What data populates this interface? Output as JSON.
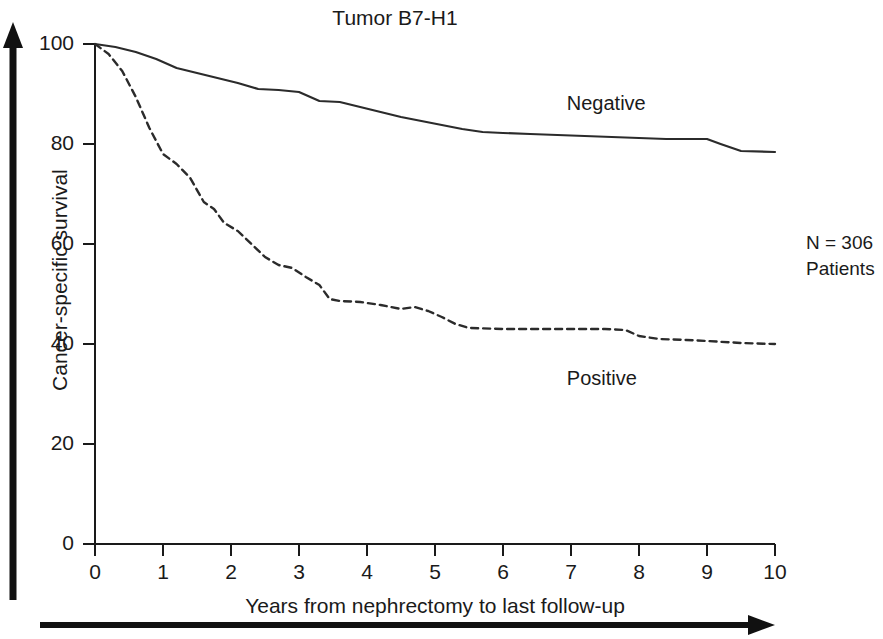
{
  "chart_data": {
    "type": "line",
    "title": "Tumor B7-H1",
    "xlabel": "Years from nephrectomy to last follow-up",
    "ylabel": "Cancer-specific survival",
    "xlim": [
      0,
      10
    ],
    "ylim": [
      0,
      100
    ],
    "xticks": [
      "0",
      "1",
      "2",
      "3",
      "4",
      "5",
      "6",
      "7",
      "8",
      "9",
      "10"
    ],
    "yticks": [
      "0",
      "20",
      "40",
      "60",
      "80",
      "100"
    ],
    "grid": false,
    "legend_position": "inline-annotation",
    "annotations": [
      "N = 306",
      "Patients"
    ],
    "series": [
      {
        "name": "Negative",
        "style": "solid",
        "color": "#2b2b2b",
        "label_x": 7.6,
        "label_y": 88,
        "x": [
          0,
          0.3,
          0.6,
          0.9,
          1.2,
          1.5,
          1.8,
          2.1,
          2.4,
          2.7,
          3.0,
          3.3,
          3.6,
          3.9,
          4.2,
          4.5,
          4.8,
          5.1,
          5.4,
          5.7,
          6.0,
          6.4,
          6.8,
          7.2,
          7.6,
          8.0,
          8.4,
          8.8,
          9.0,
          9.2,
          9.5,
          10.0
        ],
        "y": [
          100,
          99.4,
          98.4,
          97.0,
          95.2,
          94.2,
          93.2,
          92.2,
          91.0,
          90.8,
          90.4,
          88.6,
          88.4,
          87.4,
          86.4,
          85.4,
          84.6,
          83.8,
          83.0,
          82.4,
          82.2,
          82.0,
          81.8,
          81.6,
          81.4,
          81.2,
          81.0,
          81.0,
          81.0,
          80.0,
          78.6,
          78.4
        ]
      },
      {
        "name": "Positive",
        "style": "dashed",
        "color": "#2b2b2b",
        "label_x": 7.6,
        "label_y": 33,
        "x": [
          0,
          0.2,
          0.4,
          0.6,
          0.8,
          1.0,
          1.2,
          1.4,
          1.6,
          1.75,
          1.9,
          2.1,
          2.3,
          2.5,
          2.7,
          2.9,
          3.1,
          3.3,
          3.45,
          3.6,
          3.9,
          4.2,
          4.5,
          4.7,
          4.9,
          5.1,
          5.3,
          5.5,
          6.0,
          6.5,
          7.0,
          7.5,
          7.8,
          8.0,
          8.3,
          8.7,
          9.0,
          9.5,
          10.0
        ],
        "y": [
          100,
          98.0,
          94.6,
          89.4,
          83.2,
          78.0,
          76.0,
          73.2,
          68.4,
          67.0,
          64.2,
          62.6,
          60.0,
          57.4,
          55.8,
          55.2,
          53.4,
          51.8,
          49.0,
          48.6,
          48.4,
          47.8,
          47.0,
          47.4,
          46.6,
          45.4,
          44.0,
          43.2,
          43.0,
          43.0,
          43.0,
          43.0,
          42.8,
          41.6,
          41.0,
          40.8,
          40.6,
          40.2,
          40.0
        ]
      }
    ]
  }
}
